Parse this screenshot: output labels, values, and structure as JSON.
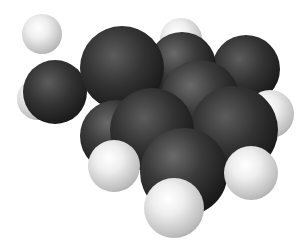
{
  "image": {
    "subject": "space-filling molecular model",
    "colors": {
      "background": "#ffffff",
      "carbon": "#2a2a2a",
      "hydrogen": "#e6e6e6"
    },
    "atoms": [
      {
        "id": "h1",
        "type": "H",
        "x": 22,
        "y": 14,
        "r": 20,
        "z": 1
      },
      {
        "id": "h2",
        "type": "H",
        "x": 17,
        "y": 78,
        "r": 21,
        "z": 1
      },
      {
        "id": "c1",
        "type": "C",
        "x": 23,
        "y": 60,
        "r": 32,
        "z": 2
      },
      {
        "id": "h3",
        "type": "H",
        "x": 160,
        "y": 18,
        "r": 21,
        "z": 1
      },
      {
        "id": "c2",
        "type": "C",
        "x": 212,
        "y": 35,
        "r": 34,
        "z": 2
      },
      {
        "id": "c3",
        "type": "C",
        "x": 148,
        "y": 32,
        "r": 34,
        "z": 3
      },
      {
        "id": "c4",
        "type": "C",
        "x": 80,
        "y": 26,
        "r": 42,
        "z": 4
      },
      {
        "id": "c5",
        "type": "C",
        "x": 160,
        "y": 60,
        "r": 40,
        "z": 5
      },
      {
        "id": "h4",
        "type": "H",
        "x": 246,
        "y": 90,
        "r": 24,
        "z": 4
      },
      {
        "id": "c6",
        "type": "C",
        "x": 80,
        "y": 100,
        "r": 36,
        "z": 5
      },
      {
        "id": "c7",
        "type": "C",
        "x": 190,
        "y": 86,
        "r": 44,
        "z": 6
      },
      {
        "id": "c8",
        "type": "C",
        "x": 110,
        "y": 88,
        "r": 42,
        "z": 6
      },
      {
        "id": "c9",
        "type": "C",
        "x": 140,
        "y": 128,
        "r": 44,
        "z": 7
      },
      {
        "id": "h5",
        "type": "H",
        "x": 88,
        "y": 140,
        "r": 26,
        "z": 8
      },
      {
        "id": "h6",
        "type": "H",
        "x": 224,
        "y": 146,
        "r": 27,
        "z": 8
      },
      {
        "id": "h7",
        "type": "H",
        "x": 144,
        "y": 178,
        "r": 30,
        "z": 9
      }
    ]
  }
}
